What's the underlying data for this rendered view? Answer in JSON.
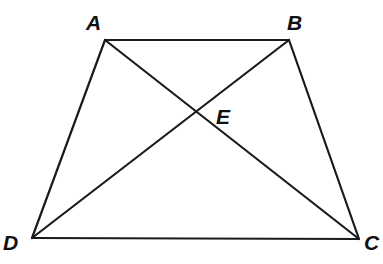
{
  "diagram": {
    "type": "trapezoid-with-diagonals",
    "vertices": {
      "A": {
        "label": "A",
        "x": 105,
        "y": 40
      },
      "B": {
        "label": "B",
        "x": 289,
        "y": 40
      },
      "C": {
        "label": "C",
        "x": 359,
        "y": 239
      },
      "D": {
        "label": "D",
        "x": 32,
        "y": 238
      },
      "E": {
        "label": "E",
        "x": 198,
        "y": 111
      }
    },
    "segments": [
      {
        "name": "AB",
        "from": "A",
        "to": "B"
      },
      {
        "name": "BC",
        "from": "B",
        "to": "C"
      },
      {
        "name": "CD",
        "from": "C",
        "to": "D"
      },
      {
        "name": "DA",
        "from": "D",
        "to": "A"
      },
      {
        "name": "AC",
        "from": "A",
        "to": "C"
      },
      {
        "name": "BD",
        "from": "B",
        "to": "D"
      }
    ],
    "labels": {
      "A": "A",
      "B": "B",
      "C": "C",
      "D": "D",
      "E": "E"
    },
    "line_color": "#1a1a1a"
  }
}
